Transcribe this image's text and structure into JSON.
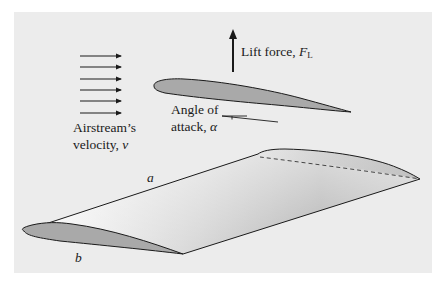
{
  "figure": {
    "labels": {
      "lift_force": "Lift force, ",
      "lift_symbol": "F",
      "lift_subscript": "L",
      "airstream_line1": "Airstream’s",
      "airstream_line2": "velocity, ",
      "velocity_symbol": "v",
      "angle_line1": "Angle of",
      "angle_line2": "attack, ",
      "angle_symbol": "α",
      "point_a": "a",
      "point_b": "b"
    },
    "colors": {
      "panel_bg": "#ececec",
      "airfoil_fill": "#a9a9a9",
      "stroke": "#1a1a1a",
      "wing_top_light": "#fafafa",
      "wing_top_dark": "#9a9a9a"
    },
    "airstream_arrow_count": 6
  }
}
